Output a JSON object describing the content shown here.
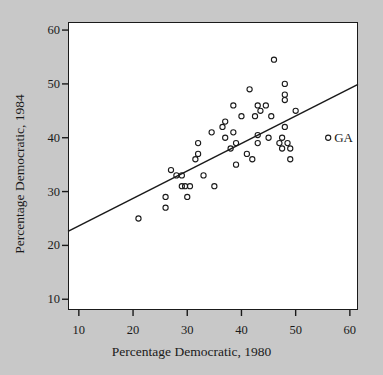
{
  "chart_data": {
    "type": "scatter",
    "title": "",
    "xlabel": "Percentage Democratic, 1980",
    "ylabel": "Percentage Democratic, 1984",
    "xlim": [
      8,
      61.5
    ],
    "ylim": [
      8,
      61.5
    ],
    "xticks": [
      10,
      20,
      30,
      40,
      50,
      60
    ],
    "yticks": [
      10,
      20,
      30,
      40,
      50,
      60
    ],
    "xtick_labels": [
      "10",
      "20",
      "30",
      "40",
      "50",
      "60"
    ],
    "ytick_labels": [
      "10",
      "20",
      "30",
      "40",
      "50",
      "60"
    ],
    "grid": false,
    "legend": "none",
    "marker": "open-circle",
    "marker_color": "#1a1a1a",
    "background_color": "#c8c8c8",
    "panel_color": "#ffffff",
    "points": [
      [
        21,
        25
      ],
      [
        26,
        27
      ],
      [
        26,
        29
      ],
      [
        27,
        34
      ],
      [
        28,
        33
      ],
      [
        29,
        33
      ],
      [
        29,
        31
      ],
      [
        29.6,
        31
      ],
      [
        30,
        29
      ],
      [
        30.5,
        31
      ],
      [
        31.5,
        36
      ],
      [
        32,
        37
      ],
      [
        32,
        39
      ],
      [
        33,
        33
      ],
      [
        34.5,
        41
      ],
      [
        35,
        31
      ],
      [
        36.5,
        42
      ],
      [
        37,
        43
      ],
      [
        37,
        40
      ],
      [
        38,
        38
      ],
      [
        38.5,
        41
      ],
      [
        38.5,
        46
      ],
      [
        39,
        39
      ],
      [
        39,
        35
      ],
      [
        40,
        44
      ],
      [
        41,
        37
      ],
      [
        41.5,
        49
      ],
      [
        42,
        36
      ],
      [
        42.5,
        44
      ],
      [
        43,
        46
      ],
      [
        43,
        40.5
      ],
      [
        43,
        39
      ],
      [
        43.5,
        45
      ],
      [
        44.5,
        46
      ],
      [
        45,
        40
      ],
      [
        45.5,
        44
      ],
      [
        46,
        54.5
      ],
      [
        47,
        39
      ],
      [
        47.5,
        38
      ],
      [
        47.5,
        40
      ],
      [
        48,
        50
      ],
      [
        48,
        48
      ],
      [
        48,
        47
      ],
      [
        48,
        42
      ],
      [
        48.5,
        39
      ],
      [
        49,
        38
      ],
      [
        49,
        36
      ],
      [
        50,
        45
      ]
    ],
    "fit_line": {
      "x_start": 8,
      "y_start": 22.6,
      "x_end": 61.5,
      "y_end": 49.9
    },
    "annotations": [
      {
        "label": "GA",
        "marker_x": 56,
        "marker_y": 40
      }
    ]
  }
}
